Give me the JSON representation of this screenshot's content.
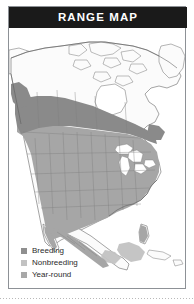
{
  "panel": {
    "title": "RANGE MAP",
    "title_bar_color": "#1a1a1a",
    "title_text_color": "#ffffff",
    "border_color": "#8d9196",
    "background_color": "#ffffff"
  },
  "map": {
    "region": "North America",
    "ocean_color": "#ffffff",
    "land_color": "#fbfbfb",
    "border_line_color": "#5a5a5a",
    "state_line_color": "#7f7f7f",
    "lake_color": "#ffffff"
  },
  "legend": {
    "items": [
      {
        "label": "Breeding",
        "color": "#8f8f8f",
        "swatch": "square-swatch"
      },
      {
        "label": "Nonbreeding",
        "color": "#c2c2c2",
        "swatch": "square-swatch"
      },
      {
        "label": "Year-round",
        "color": "#a8a8a8",
        "swatch": "square-swatch"
      }
    ]
  },
  "ranges": {
    "breeding_fill": "#8a8a8a",
    "nonbreeding_fill": "#c2c2c2",
    "yearround_fill": "#a6a6a6"
  },
  "footer": {
    "dotted_rule_color": "#b9b9b9"
  }
}
